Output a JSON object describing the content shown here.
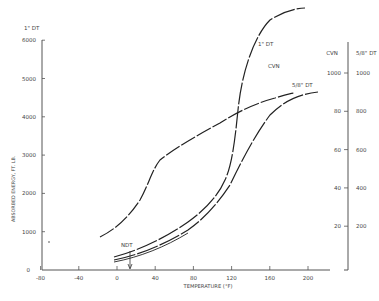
{
  "chart_data": {
    "type": "line",
    "title": "",
    "xlabel": "TEMPERATURE (°F)",
    "ylabel": "ABSORBED ENERGY, FT. LB.",
    "left_axis_title": "1\" DT",
    "right_axis_titles": [
      "CVN",
      "5/8\" DT"
    ],
    "xlim": [
      -80,
      220
    ],
    "ylim_left": [
      0,
      6000
    ],
    "x_ticks": [
      -80,
      -40,
      0,
      40,
      80,
      120,
      160,
      200
    ],
    "y_ticks_left": [
      0,
      1000,
      2000,
      3000,
      4000,
      5000,
      6000
    ],
    "y_ticks_right_cvn": [
      20,
      40,
      60,
      80,
      100
    ],
    "y_ticks_right_cvn_labels": [
      "20",
      "40",
      "60",
      "80",
      "1000"
    ],
    "y_ticks_right_58dt": [
      200,
      400,
      600,
      800,
      1000
    ],
    "grid": false,
    "annotations": [
      {
        "text": "NDT",
        "x": 15,
        "note": "arrow pointing down to x-axis at NDT temperature"
      }
    ],
    "series": [
      {
        "name": "1\" DT",
        "label": "1\" DT",
        "axis": "left (1\" DT, ft-lb)",
        "x": [
          0,
          20,
          40,
          60,
          80,
          100,
          120,
          130,
          140,
          150,
          160,
          180,
          200
        ],
        "y": [
          300,
          400,
          650,
          1000,
          1500,
          2050,
          2800,
          3800,
          5200,
          6000,
          6300,
          6500,
          6550
        ]
      },
      {
        "name": "CVN",
        "label": "CVN",
        "axis": "right (CVN, ft-lb)",
        "x": [
          -15,
          0,
          20,
          40,
          60,
          80,
          100,
          120,
          140,
          160,
          180
        ],
        "y": [
          16,
          20,
          34,
          52,
          60,
          68,
          76,
          85,
          93,
          97,
          99
        ]
      },
      {
        "name": "5/8\" DT",
        "label": "5/8\" DT",
        "axis": "right (5/8\" DT, ft-lb)",
        "x": [
          0,
          20,
          40,
          60,
          80,
          100,
          120,
          140,
          160,
          180,
          200,
          210
        ],
        "y": [
          50,
          70,
          120,
          200,
          280,
          380,
          520,
          720,
          840,
          900,
          930,
          935
        ]
      }
    ]
  }
}
